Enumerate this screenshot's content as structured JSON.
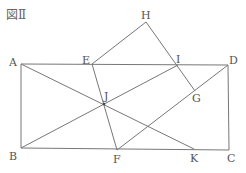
{
  "title": "図Ⅱ",
  "points": {
    "A": {
      "label": "A",
      "x": 21,
      "y": 64,
      "lx": 9,
      "ly": 57
    },
    "B": {
      "label": "B",
      "x": 21,
      "y": 148,
      "lx": 9,
      "ly": 151
    },
    "C": {
      "label": "C",
      "x": 229,
      "y": 150,
      "lx": 227,
      "ly": 153
    },
    "D": {
      "label": "D",
      "x": 228,
      "y": 65,
      "lx": 229,
      "ly": 55
    },
    "E": {
      "label": "E",
      "x": 92,
      "y": 64,
      "lx": 82,
      "ly": 55
    },
    "H": {
      "label": "H",
      "x": 146,
      "y": 22,
      "lx": 141,
      "ly": 10
    },
    "I": {
      "label": "I",
      "x": 178,
      "y": 65,
      "lx": 176,
      "ly": 54
    },
    "G": {
      "label": "G",
      "x": 195,
      "y": 91,
      "lx": 192,
      "ly": 93
    },
    "J": {
      "label": "J",
      "x": 104,
      "y": 104,
      "lx": 104,
      "ly": 91
    },
    "F": {
      "label": "F",
      "x": 117,
      "y": 150,
      "lx": 113,
      "ly": 154
    },
    "K": {
      "label": "K",
      "x": 194,
      "y": 149,
      "lx": 190,
      "ly": 153
    }
  },
  "segments": [
    [
      "A",
      "D"
    ],
    [
      "A",
      "B"
    ],
    [
      "B",
      "C"
    ],
    [
      "C",
      "D"
    ],
    [
      "A",
      "K"
    ],
    [
      "B",
      "I"
    ],
    [
      "E",
      "F"
    ],
    [
      "E",
      "H"
    ],
    [
      "H",
      "G"
    ],
    [
      "F",
      "D"
    ]
  ],
  "style": {
    "stroke": "#777777"
  }
}
